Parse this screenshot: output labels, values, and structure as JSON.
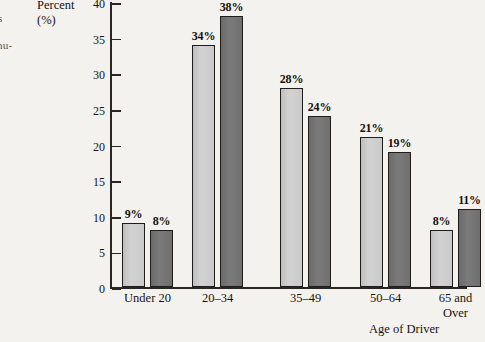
{
  "margin_fragments": {
    "line1": "s",
    "line2": "nu-"
  },
  "chart_data": {
    "type": "bar",
    "title": "",
    "subtitle": "",
    "xlabel": "Age of Driver",
    "ylabel": "Percent (%)",
    "ylabel_line1": "Percent",
    "ylabel_line2": "(%)",
    "categories": [
      "Under 20",
      "20–34",
      "35–49",
      "50–64",
      "65 and Over"
    ],
    "category_lines": [
      [
        "Under 20"
      ],
      [
        "20–34"
      ],
      [
        "35–49"
      ],
      [
        "50–64"
      ],
      [
        "65 and",
        "Over"
      ]
    ],
    "series": [
      {
        "name": "series-1-light",
        "color": "#cacaca",
        "values": [
          9,
          34,
          28,
          21,
          8
        ],
        "labels": [
          "9%",
          "34%",
          "28%",
          "21%",
          "8%"
        ]
      },
      {
        "name": "series-2-dark",
        "color": "#6f6f6f",
        "values": [
          8,
          38,
          24,
          19,
          11
        ],
        "labels": [
          "8%",
          "38%",
          "24%",
          "19%",
          "11%"
        ]
      }
    ],
    "ylim": [
      0,
      40
    ],
    "ytick_step": 5,
    "ytick_labels": [
      "0",
      "5",
      "10",
      "15",
      "20",
      "25",
      "30",
      "35",
      "40"
    ],
    "ytick_values": [
      0,
      5,
      10,
      15,
      20,
      25,
      30,
      35,
      40
    ],
    "grid": false,
    "legend": "none",
    "value_labels_shown": true,
    "axis_color": "#2a2622"
  }
}
